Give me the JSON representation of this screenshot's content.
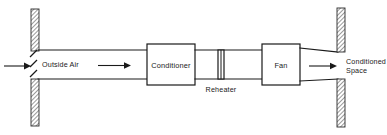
{
  "diagram": {
    "type": "hvac-airflow-schematic",
    "colors": {
      "line": "#1a1a1a",
      "background": "#ffffff",
      "wall_hatch": "#8a8a8a"
    },
    "labels": {
      "outside_air": "Outside Air",
      "conditioner": "Conditioner",
      "reheater": "Reheater",
      "fan": "Fan",
      "conditioned_space_line1": "Conditioned",
      "conditioned_space_line2": "Space"
    },
    "components": [
      {
        "name": "outside-air-inlet",
        "label": "Outside Air",
        "kind": "duct-inlet"
      },
      {
        "name": "conditioner",
        "label": "Conditioner",
        "kind": "box"
      },
      {
        "name": "reheater",
        "label": "Reheater",
        "kind": "coil"
      },
      {
        "name": "fan",
        "label": "Fan",
        "kind": "box"
      },
      {
        "name": "conditioned-space",
        "label": "Conditioned Space",
        "kind": "outlet"
      }
    ],
    "flow_arrows": [
      {
        "name": "inlet-arrow",
        "direction": "right"
      },
      {
        "name": "duct-arrow",
        "direction": "right"
      },
      {
        "name": "outlet-arrow",
        "direction": "right"
      }
    ],
    "walls": [
      {
        "name": "left-wall",
        "side": "left",
        "hatched": true,
        "segments": 2
      },
      {
        "name": "right-wall",
        "side": "right",
        "hatched": true,
        "segments": 2
      }
    ]
  }
}
